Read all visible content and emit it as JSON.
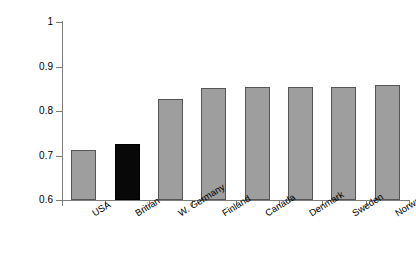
{
  "chart_data": {
    "type": "bar",
    "title": "",
    "subtitle": "",
    "xlabel": "",
    "ylabel": "Relative social mobility",
    "categories": [
      "USA",
      "Britian",
      "W. Germany",
      "Finland",
      "Canada",
      "Denmark",
      "Sweden",
      "Norway"
    ],
    "values": [
      0.712,
      0.727,
      0.827,
      0.851,
      0.855,
      0.854,
      0.854,
      0.858
    ],
    "ylim": [
      0.6,
      1
    ],
    "ytick_labels": [
      "0.6",
      "0.7",
      "0.8",
      "0.9",
      "1"
    ],
    "ytick_values": [
      0.6,
      0.7,
      0.8,
      0.9,
      1
    ],
    "grid": false,
    "legend": "none",
    "highlighted_category": "Britian",
    "bar_color": "#9e9e9e",
    "highlight_color": "#080808",
    "bar_border_color": "#555555",
    "axis_color": "#7d7d7d"
  },
  "axis": {
    "y_title": "Relative social mobility",
    "y_ticks": [
      {
        "label": "1",
        "value": 1
      },
      {
        "label": "0.9",
        "value": 0.9
      },
      {
        "label": "0.8",
        "value": 0.8
      },
      {
        "label": "0.7",
        "value": 0.7
      },
      {
        "label": "0.6",
        "value": 0.6
      }
    ]
  },
  "bars": [
    {
      "label": "USA",
      "value": 0.712,
      "highlighted": false
    },
    {
      "label": "Britian",
      "value": 0.727,
      "highlighted": true
    },
    {
      "label": "W. Germany",
      "value": 0.827,
      "highlighted": false
    },
    {
      "label": "Finland",
      "value": 0.851,
      "highlighted": false
    },
    {
      "label": "Canada",
      "value": 0.855,
      "highlighted": false
    },
    {
      "label": "Denmark",
      "value": 0.854,
      "highlighted": false
    },
    {
      "label": "Sweden",
      "value": 0.854,
      "highlighted": false
    },
    {
      "label": "Norway",
      "value": 0.858,
      "highlighted": false
    }
  ]
}
